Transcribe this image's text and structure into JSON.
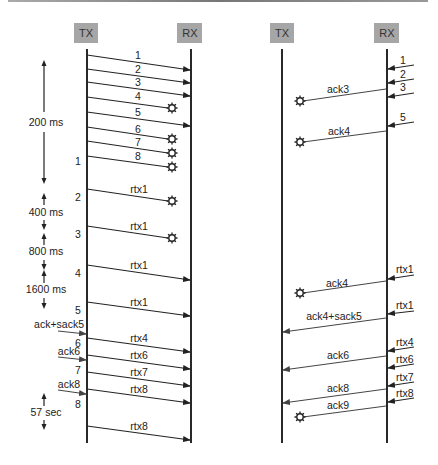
{
  "left_diagram": {
    "tx_label": "TX",
    "rx_label": "RX",
    "messages": [
      {
        "label": "1",
        "status": "delivered"
      },
      {
        "label": "2",
        "status": "delivered"
      },
      {
        "label": "3",
        "status": "delivered"
      },
      {
        "label": "4",
        "status": "lost"
      },
      {
        "label": "5",
        "status": "delivered"
      },
      {
        "label": "6",
        "status": "lost"
      },
      {
        "label": "7",
        "status": "lost"
      },
      {
        "label": "8",
        "status": "lost"
      },
      {
        "label": "rtx1",
        "status": "lost"
      },
      {
        "label": "rtx1",
        "status": "lost"
      },
      {
        "label": "rtx1",
        "status": "delivered"
      },
      {
        "label": "rtx1",
        "status": "delivered"
      },
      {
        "label": "rtx4",
        "status": "delivered"
      },
      {
        "label": "rtx6",
        "status": "delivered"
      },
      {
        "label": "rtx7",
        "status": "delivered"
      },
      {
        "label": "rtx8",
        "status": "delivered"
      },
      {
        "label": "rtx8",
        "status": "delivered"
      }
    ],
    "timeout_markers": [
      "1",
      "2",
      "3",
      "4",
      "5",
      "6",
      "7",
      "8"
    ],
    "intervals": [
      "200 ms",
      "400 ms",
      "800 ms",
      "1600 ms",
      "57 sec"
    ],
    "incoming_acks": [
      "ack+sack5",
      "ack6",
      "ack8"
    ]
  },
  "right_diagram": {
    "tx_label": "TX",
    "rx_label": "RX",
    "incoming": [
      "1",
      "2",
      "3",
      "5",
      "rtx1",
      "rtx1",
      "rtx4",
      "rtx6",
      "rtx7",
      "rtx8"
    ],
    "acks": [
      {
        "label": "ack3",
        "status": "lost"
      },
      {
        "label": "ack4",
        "status": "lost"
      },
      {
        "label": "ack4",
        "status": "lost"
      },
      {
        "label": "ack4+sack5",
        "status": "delivered"
      },
      {
        "label": "ack6",
        "status": "delivered"
      },
      {
        "label": "ack8",
        "status": "delivered"
      },
      {
        "label": "ack9",
        "status": "lost"
      }
    ]
  }
}
